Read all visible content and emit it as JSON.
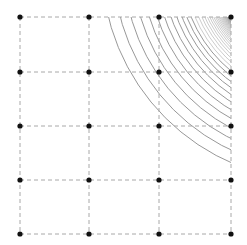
{
  "diagram": {
    "type": "grid-with-concentric-arcs",
    "grid": {
      "columns_x": [
        20,
        89,
        159,
        231
      ],
      "rows_y": [
        17,
        72,
        126,
        180,
        234
      ],
      "line_color": "#a8a8a8",
      "dash": "4 3",
      "dot_color": "#111111",
      "dot_radius": 2.6
    },
    "arcs": {
      "center": [
        318,
        -35
      ],
      "r_max": 216,
      "r_min": 101,
      "count": 40,
      "decay": 0.9,
      "stroke_color": "#8c8c8c",
      "clip_rect": [
        20,
        17,
        231,
        234
      ]
    }
  }
}
